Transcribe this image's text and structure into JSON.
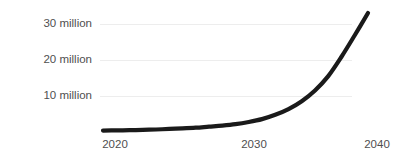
{
  "chart_data": {
    "type": "line",
    "title": "",
    "subtitle": "",
    "xlabel": "",
    "ylabel": "",
    "x": [
      2020,
      2021,
      2022,
      2023,
      2024,
      2025,
      2026,
      2027,
      2028,
      2029,
      2030,
      2031,
      2032,
      2033,
      2034,
      2035,
      2036,
      2037,
      2038,
      2039,
      2040
    ],
    "values": [
      0.4,
      0.45,
      0.5,
      0.6,
      0.7,
      0.85,
      1.0,
      1.2,
      1.5,
      1.8,
      2.2,
      2.8,
      3.6,
      4.8,
      6.4,
      8.6,
      11.6,
      15.6,
      21.0,
      27.0,
      33.2
    ],
    "series": [
      {
        "name": "",
        "color": "#1a1a1a",
        "values": [
          0.4,
          0.45,
          0.5,
          0.6,
          0.7,
          0.85,
          1.0,
          1.2,
          1.5,
          1.8,
          2.2,
          2.8,
          3.6,
          4.8,
          6.4,
          8.6,
          11.6,
          15.6,
          21.0,
          27.0,
          33.2
        ]
      }
    ],
    "xlim": [
      2020,
      2040
    ],
    "ylim": [
      0,
      33.2
    ],
    "grid": true,
    "grid_axis": "y",
    "legend": false,
    "legend_position": "none",
    "y_ticks": [
      {
        "value": 10,
        "label": "10 million"
      },
      {
        "value": 20,
        "label": "20 million"
      },
      {
        "value": 30,
        "label": "30 million"
      }
    ],
    "x_ticks": [
      {
        "value": 2020,
        "label": "2020"
      },
      {
        "value": 2030,
        "label": "2030"
      },
      {
        "value": 2040,
        "label": "2040"
      }
    ],
    "annotations": []
  },
  "colors": {
    "background": "#ffffff",
    "curve": "#1a1a1a",
    "gridline": "#ededed",
    "tick_text": "#4f4f4f"
  }
}
